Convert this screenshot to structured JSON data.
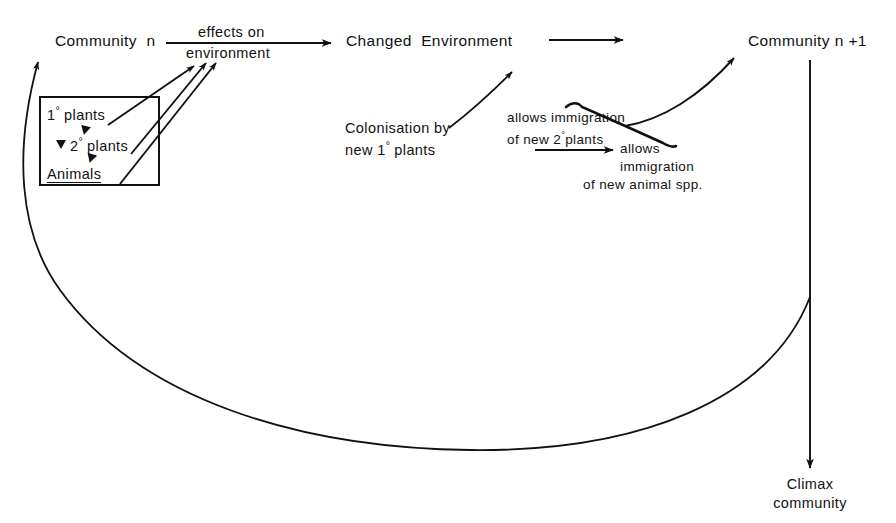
{
  "diagram": {
    "stroke_color": "#111111",
    "background": "#ffffff"
  },
  "nodes": {
    "community_n": "Community  n",
    "changed_environment": "Changed  Environment",
    "community_n_plus_1": "Community n +1",
    "climax_line1": "Climax",
    "climax_line2": "community"
  },
  "box": {
    "primary_plants_num": "1",
    "primary_plants_text": " plants",
    "secondary_plants_num": "2",
    "secondary_plants_text": " plants",
    "animals": "Animals",
    "degree_symbol": "°"
  },
  "edge_labels": {
    "effects_on": "effects on",
    "environment": "environment",
    "colonisation_line1": "Colonisation by",
    "colonisation_line2_pre": "new 1",
    "colonisation_line2_post": " plants",
    "allows_imm_plants_line1": "allows immigration",
    "allows_imm_plants_line2_pre": "of new 2",
    "allows_imm_plants_line2_post": "plants",
    "allows_imm_animals_line1": "allows",
    "allows_imm_animals_line2": "immigration",
    "allows_imm_animals_line3": "of new animal spp."
  }
}
